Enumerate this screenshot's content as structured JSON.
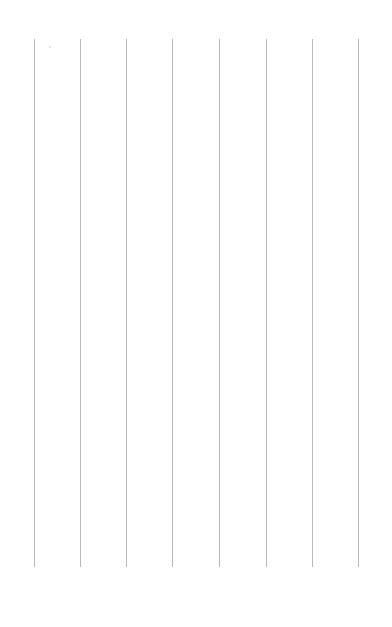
{
  "page": {
    "background": "#ffffff",
    "rule_color": "#b8b8b8",
    "rules": [
      {
        "x": 34
      },
      {
        "x": 80
      },
      {
        "x": 126
      },
      {
        "x": 172
      },
      {
        "x": 219
      },
      {
        "x": 266
      },
      {
        "x": 312
      },
      {
        "x": 358
      }
    ],
    "rule_top": 39,
    "rule_bottom": 567
  }
}
